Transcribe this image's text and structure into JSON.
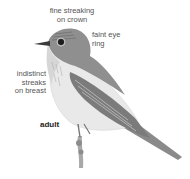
{
  "illustration": {
    "subject": "bird-perched-on-twig",
    "labels": {
      "crown": "fine streaking on crown",
      "crown_line1": "fine streaking",
      "crown_line2": "on crown",
      "eye": "faint eye ring",
      "eye_line1": "faint eye",
      "eye_line2": "ring",
      "breast": "indistinct streaks on breast",
      "breast_line1": "indistinct",
      "breast_line2": "streaks",
      "breast_line3": "on breast",
      "age": "adult"
    },
    "colors": {
      "background": "#ffffff",
      "label_text": "#555555",
      "age_text": "#222222",
      "plumage_dark": "#6f6f6f",
      "plumage_mid": "#9a9a9a",
      "underparts": "#eeeeee"
    }
  }
}
